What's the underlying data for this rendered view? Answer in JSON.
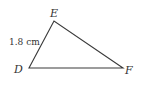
{
  "diagram": {
    "type": "triangle",
    "stroke_color": "#3a3a3a",
    "vertices": [
      {
        "name": "E",
        "x": 54,
        "y": 21,
        "label_x": 50,
        "label_y": 17
      },
      {
        "name": "D",
        "x": 29,
        "y": 68,
        "label_x": 14,
        "label_y": 73
      },
      {
        "name": "F",
        "x": 123,
        "y": 68,
        "label_x": 125,
        "label_y": 74
      }
    ],
    "sides": [
      {
        "from": "D",
        "to": "E",
        "length_label": "1.8 cm"
      }
    ]
  }
}
